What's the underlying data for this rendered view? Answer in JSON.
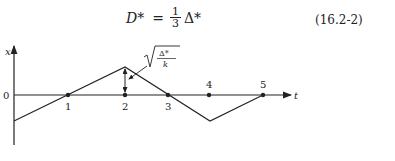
{
  "equation": {
    "lhs": "D*",
    "equals": "=",
    "frac_num": "1",
    "frac_den": "3",
    "rhs": "Δ*",
    "number": "(16.2-2)"
  },
  "diagram": {
    "y_axis_label": "x",
    "x_axis_label": "t",
    "origin_label": "0",
    "points": [
      "1",
      "2",
      "3",
      "4",
      "5"
    ],
    "annotation": "√(Δ*/k)",
    "annotation_num": "Δ*",
    "annotation_den": "k"
  }
}
